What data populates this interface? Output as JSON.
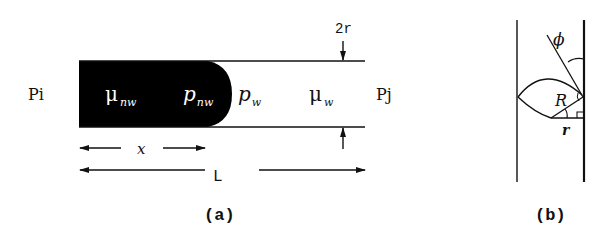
{
  "figure_a": {
    "caption": "(a)",
    "inlet_pressure": "Pi",
    "outlet_pressure": "Pj",
    "diameter_label": "2r",
    "nonwetting_viscosity": {
      "symbol": "μ",
      "subscript": "nw"
    },
    "nonwetting_pressure": {
      "symbol": "p",
      "subscript": "nw"
    },
    "wetting_pressure": {
      "symbol": "p",
      "subscript": "w"
    },
    "wetting_viscosity": {
      "symbol": "μ",
      "subscript": "w"
    },
    "interface_position_label": "x",
    "length_label": "L"
  },
  "figure_b": {
    "caption": "(b)",
    "contact_angle_label": "ϕ",
    "curvature_radius_label": "R",
    "tube_radius_label": "r"
  },
  "colors": {
    "nonwetting_fluid": "#000000",
    "lines": "#111111",
    "background": "#ffffff"
  }
}
